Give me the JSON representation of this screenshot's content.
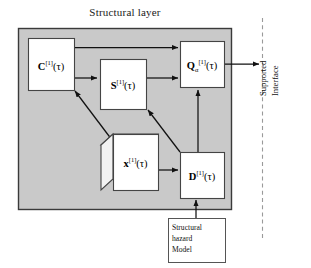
{
  "diagram": {
    "title": "Structural layer",
    "panel": {
      "fill_color": "#c9c9c9",
      "border_color": "#3a3a3a"
    },
    "nodes": [
      {
        "id": "C",
        "shape": "rect",
        "symbol": "C",
        "superscript": "[1]",
        "subscript": "",
        "argument": "(τ)",
        "label_plain": "C[1](τ)"
      },
      {
        "id": "S",
        "shape": "rect",
        "symbol": "S",
        "superscript": "[1]",
        "subscript": "",
        "argument": "(τ)",
        "label_plain": "S[1](τ)"
      },
      {
        "id": "Q",
        "shape": "rect",
        "symbol": "Q",
        "superscript": "[1]",
        "subscript": "α",
        "argument": "(τ)",
        "label_plain": "Qα[1](τ)"
      },
      {
        "id": "x",
        "shape": "cube",
        "symbol": "x",
        "superscript": "[1]",
        "subscript": "",
        "argument": "(τ)",
        "label_plain": "x[1](τ)"
      },
      {
        "id": "D",
        "shape": "rect",
        "symbol": "D",
        "superscript": "[1]",
        "subscript": "",
        "argument": "(τ)",
        "label_plain": "D[1](τ)"
      }
    ],
    "model_box": {
      "lines": [
        "Structural",
        "hazard",
        "Model"
      ]
    },
    "boundary": {
      "style": "dashed",
      "label_lines": [
        "Supported",
        "Interface"
      ]
    },
    "edges": [
      {
        "from": "C",
        "to": "Q",
        "style": "solid-arrow"
      },
      {
        "from": "C",
        "to": "S",
        "style": "solid-arrow"
      },
      {
        "from": "S",
        "to": "Q",
        "style": "solid-arrow"
      },
      {
        "from": "x",
        "to": "C",
        "style": "solid-arrow-diagonal"
      },
      {
        "from": "x",
        "to": "D",
        "style": "solid-arrow"
      },
      {
        "from": "D",
        "to": "S",
        "style": "solid-arrow-diagonal"
      },
      {
        "from": "D",
        "to": "Q",
        "style": "solid-arrow"
      },
      {
        "from": "model_box",
        "to": "D",
        "style": "solid-arrow"
      },
      {
        "from": "Q",
        "to": "boundary",
        "style": "solid-arrow"
      }
    ]
  }
}
